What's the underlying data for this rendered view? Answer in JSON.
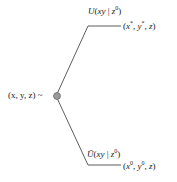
{
  "diagram": {
    "root_label": "(x, y, z) ~",
    "upper_branch": {
      "edge_label": "U(xy | z⁰)",
      "outcome": "(x*, y*, z)"
    },
    "lower_branch": {
      "edge_label": "Ū(xy | z⁰)",
      "outcome": "(x⁰, y⁰, z)"
    },
    "node_color": "#999999",
    "line_color": "#333333"
  }
}
